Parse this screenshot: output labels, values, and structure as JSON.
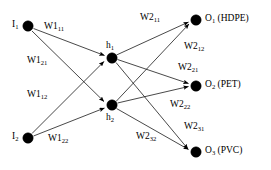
{
  "diagram": {
    "type": "neural-network",
    "colors": {
      "node": "#000000",
      "edge": "#1a1a1a",
      "background": "#ffffff",
      "text": "#000000"
    },
    "layers": [
      {
        "name": "input",
        "nodes": [
          {
            "id": "I1",
            "base": "I",
            "sub": "1",
            "label": "I1",
            "x": 28,
            "y": 26,
            "r": 5.2,
            "label_pos": "left"
          },
          {
            "id": "I2",
            "base": "I",
            "sub": "2",
            "label": "I2",
            "x": 28,
            "y": 138,
            "r": 5.2,
            "label_pos": "left"
          }
        ]
      },
      {
        "name": "hidden",
        "nodes": [
          {
            "id": "h1",
            "base": "h",
            "sub": "1",
            "label": "h1",
            "x": 112,
            "y": 58,
            "r": 5.2,
            "label_pos": "above"
          },
          {
            "id": "h2",
            "base": "h",
            "sub": "2",
            "label": "h2",
            "x": 112,
            "y": 105,
            "r": 5.2,
            "label_pos": "below"
          }
        ]
      },
      {
        "name": "output",
        "nodes": [
          {
            "id": "O1",
            "base": "O",
            "sub": "1",
            "name": "(HDPE)",
            "label": "O1 (HDPE)",
            "x": 196,
            "y": 20,
            "r": 5.2,
            "label_pos": "right"
          },
          {
            "id": "O2",
            "base": "O",
            "sub": "2",
            "name": "(PET)",
            "label": "O2 (PET)",
            "x": 196,
            "y": 86,
            "r": 5.2,
            "label_pos": "right"
          },
          {
            "id": "O3",
            "base": "O",
            "sub": "3",
            "name": "(PVC)",
            "label": "O3 (PVC)",
            "x": 196,
            "y": 152,
            "r": 5.2,
            "label_pos": "right"
          }
        ]
      }
    ],
    "edges": [
      {
        "id": "e-I1-h1",
        "from": "I1",
        "to": "h1",
        "weight": "W111"
      },
      {
        "id": "e-I1-h2",
        "from": "I1",
        "to": "h2",
        "weight": "W112"
      },
      {
        "id": "e-I2-h1",
        "from": "I2",
        "to": "h1",
        "weight": "W121"
      },
      {
        "id": "e-I2-h2",
        "from": "I2",
        "to": "h2",
        "weight": "W122"
      },
      {
        "id": "e-h1-O1",
        "from": "h1",
        "to": "O1",
        "weight": "W211"
      },
      {
        "id": "e-h1-O2",
        "from": "h1",
        "to": "O2",
        "weight": "W221"
      },
      {
        "id": "e-h1-O3",
        "from": "h1",
        "to": "O3",
        "weight": "W231"
      },
      {
        "id": "e-h2-O1",
        "from": "h2",
        "to": "O1",
        "weight": "W212"
      },
      {
        "id": "e-h2-O2",
        "from": "h2",
        "to": "O2",
        "weight": "W222"
      },
      {
        "id": "e-h2-O3",
        "from": "h2",
        "to": "O3",
        "weight": "W232"
      }
    ],
    "weight_labels": [
      {
        "id": "w-111",
        "base": "W1",
        "sub": "11",
        "text": "W111",
        "x": 44,
        "y": 22
      },
      {
        "id": "w-121",
        "base": "W1",
        "sub": "21",
        "text": "W121",
        "x": 27,
        "y": 56
      },
      {
        "id": "w-112",
        "base": "W1",
        "sub": "12",
        "text": "W112",
        "x": 27,
        "y": 90
      },
      {
        "id": "w-122",
        "base": "W1",
        "sub": "22",
        "text": "W122",
        "x": 48,
        "y": 134
      },
      {
        "id": "w-211",
        "base": "W2",
        "sub": "11",
        "text": "W211",
        "x": 140,
        "y": 13
      },
      {
        "id": "w-212",
        "base": "W2",
        "sub": "12",
        "text": "W212",
        "x": 184,
        "y": 42
      },
      {
        "id": "w-221",
        "base": "W2",
        "sub": "21",
        "text": "W221",
        "x": 178,
        "y": 63
      },
      {
        "id": "w-222",
        "base": "W2",
        "sub": "22",
        "text": "W222",
        "x": 170,
        "y": 100
      },
      {
        "id": "w-231",
        "base": "W2",
        "sub": "31",
        "text": "W231",
        "x": 184,
        "y": 122
      },
      {
        "id": "w-232",
        "base": "W2",
        "sub": "32",
        "text": "W232",
        "x": 136,
        "y": 132
      }
    ],
    "node_labels": [
      {
        "id": "nl-I1",
        "base": "I",
        "sub": "1",
        "x": 12,
        "y": 20
      },
      {
        "id": "nl-I2",
        "base": "I",
        "sub": "2",
        "x": 12,
        "y": 132
      },
      {
        "id": "nl-h1",
        "base": "h",
        "sub": "1",
        "x": 106,
        "y": 41
      },
      {
        "id": "nl-h2",
        "base": "h",
        "sub": "2",
        "x": 106,
        "y": 113
      },
      {
        "id": "nl-O1",
        "base": "O",
        "sub": "1",
        "suffix": " (HDPE)",
        "x": 205,
        "y": 14
      },
      {
        "id": "nl-O2",
        "base": "O",
        "sub": "2",
        "suffix": " (PET)",
        "x": 205,
        "y": 80
      },
      {
        "id": "nl-O3",
        "base": "O",
        "sub": "3",
        "suffix": " (PVC)",
        "x": 205,
        "y": 146
      }
    ]
  }
}
